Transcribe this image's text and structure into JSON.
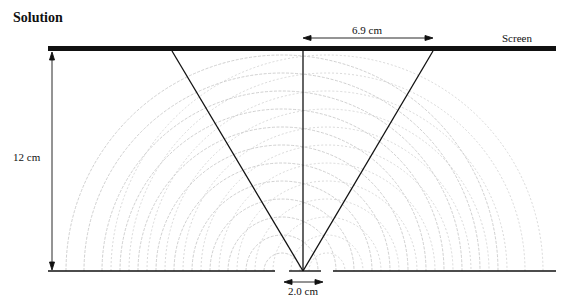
{
  "title": "Solution",
  "labels": {
    "screen": "Screen",
    "fringe_distance": "6.9 cm",
    "screen_distance": "12 cm",
    "slit_separation": "2.0 cm"
  },
  "geometry": {
    "screen": {
      "x1": 48,
      "x2": 556,
      "y": 48
    },
    "barrier_y": 271,
    "slit_centers_x": [
      282,
      327
    ],
    "center_x": 303,
    "ray_targets_x": [
      172,
      303,
      433
    ]
  },
  "colors": {
    "ink": "#111111",
    "wave": "#c8c8c8"
  }
}
